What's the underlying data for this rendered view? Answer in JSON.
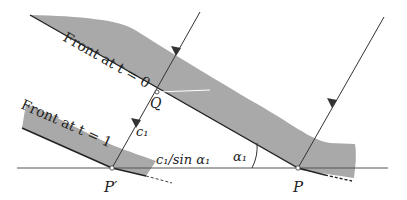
{
  "diagram": {
    "colors": {
      "band_fill": "#a9a9a9",
      "line": "#333333",
      "baseline": "#555555",
      "text": "#222222"
    },
    "labels": {
      "front_t0": "Front at t = 0",
      "front_t1": "Front at t = 1",
      "point_Q": "Q",
      "point_P": "P",
      "point_P_prime": "P′",
      "speed": "c₁",
      "interface_distance": "c₁/sin α₁",
      "angle": "α₁"
    },
    "points": {
      "P": [
        298,
        168
      ],
      "P_prime": [
        112,
        168
      ],
      "Q": [
        157,
        92
      ]
    },
    "rays": [
      {
        "name": "ray-through-Q",
        "from": [
          200,
          12
        ],
        "to": [
          112,
          168
        ],
        "arrow_at": [
          176,
          55
        ]
      },
      {
        "name": "ray-to-P",
        "from": [
          384,
          17
        ],
        "to": [
          298,
          168
        ],
        "arrow_at": [
          330,
          108
        ]
      }
    ],
    "baseline": {
      "from": [
        17,
        168
      ],
      "to": [
        388,
        168
      ]
    }
  }
}
